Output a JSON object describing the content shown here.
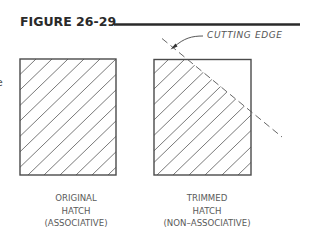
{
  "figure": {
    "title": "FIGURE 26-29",
    "partial_left_text": "e"
  },
  "annotation": {
    "cutting_edge_label": "CUTTING  EDGE"
  },
  "panels": [
    {
      "id": "original",
      "caption_lines": [
        "ORIGINAL",
        "HATCH",
        "(ASSOCIATIVE)"
      ],
      "hatch": "full diagonal hatch"
    },
    {
      "id": "trimmed",
      "caption_lines": [
        "TRIMMED",
        "HATCH",
        "(NON–ASSOCIATIVE)"
      ],
      "hatch": "hatch trimmed along cutting edge"
    }
  ],
  "colors": {
    "ink": "#4a4a4a",
    "title": "#2a2a2a",
    "background": "#ffffff"
  }
}
